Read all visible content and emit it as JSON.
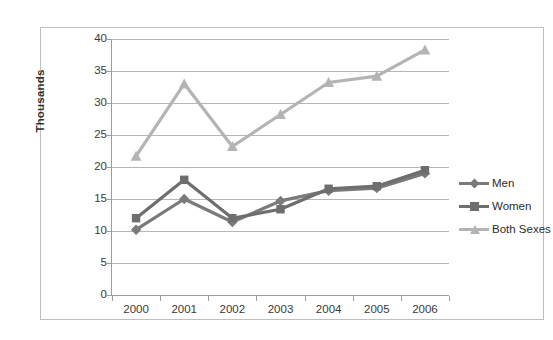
{
  "chart_data": {
    "type": "line",
    "title": "",
    "xlabel": "",
    "ylabel": "Thousands",
    "categories": [
      "2000",
      "2001",
      "2002",
      "2003",
      "2004",
      "2005",
      "2006"
    ],
    "ylim": [
      0,
      40
    ],
    "ytick_step": 5,
    "yticks": [
      "0",
      "5",
      "10",
      "15",
      "20",
      "25",
      "30",
      "35",
      "40"
    ],
    "grid": true,
    "legend_position": "right",
    "series": [
      {
        "name": "Men",
        "color": "#7a7a7a",
        "marker": "diamond",
        "values": [
          10.2,
          15.0,
          11.4,
          14.7,
          16.3,
          16.7,
          19.0
        ]
      },
      {
        "name": "Women",
        "color": "#6e6e6e",
        "marker": "square",
        "values": [
          12.0,
          18.0,
          12.0,
          13.4,
          16.6,
          17.0,
          19.5
        ]
      },
      {
        "name": "Both Sexes",
        "color": "#b4b4b4",
        "marker": "triangle",
        "values": [
          21.7,
          33.0,
          23.2,
          28.2,
          33.2,
          34.2,
          38.3
        ]
      }
    ]
  },
  "legend": {
    "items": [
      {
        "label": "Men"
      },
      {
        "label": "Women"
      },
      {
        "label": "Both Sexes"
      }
    ]
  },
  "colors": {
    "gridline": "#b6b6b6",
    "axis": "#9d9d9d",
    "frame": "#bfbfbf",
    "text": "#3a3a3a"
  }
}
